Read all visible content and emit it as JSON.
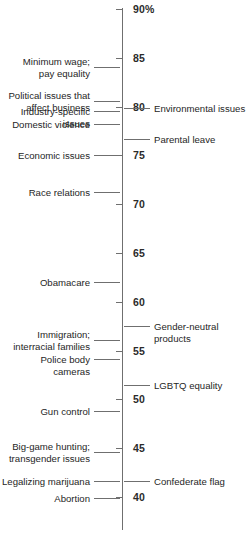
{
  "chart_data": {
    "type": "scatter",
    "title": "",
    "subtitle": "",
    "xlabel": "",
    "ylabel": "",
    "orientation": "vertical-number-line",
    "grid": false,
    "legend": null,
    "axis": {
      "min": 38,
      "max": 90,
      "tick_step": 5,
      "ticks": [
        {
          "value": 90,
          "label": "90%"
        },
        {
          "value": 85,
          "label": "85"
        },
        {
          "value": 80,
          "label": "80"
        },
        {
          "value": 75,
          "label": "75"
        },
        {
          "value": 70,
          "label": "70"
        },
        {
          "value": 65,
          "label": "65"
        },
        {
          "value": 60,
          "label": "60"
        },
        {
          "value": 55,
          "label": "55"
        },
        {
          "value": 50,
          "label": "50"
        },
        {
          "value": 45,
          "label": "45"
        },
        {
          "value": 40,
          "label": "40"
        }
      ]
    },
    "categories": [
      "Minimum wage; pay equality",
      "Political issues that affect business",
      "Environmental issues",
      "Industry-specific issues",
      "Domestic violence",
      "Parental leave",
      "Economic issues",
      "Race relations",
      "Obamacare",
      "Gender-neutral products",
      "Immigration; interracial families",
      "Police body cameras",
      "LGBTQ equality",
      "Gun control",
      "Big-game hunting; transgender issues",
      "Confederate flag",
      "Legalizing marijuana",
      "Abortion"
    ],
    "values": [
      84.1,
      80.6,
      79.9,
      79.5,
      78.2,
      76.7,
      75.0,
      71.2,
      62.0,
      57.5,
      56.1,
      54.1,
      51.5,
      48.8,
      44.6,
      41.6,
      41.6,
      39.9
    ],
    "points": [
      {
        "label": "Minimum wage;\npay equality",
        "value": 84.1,
        "side": "left"
      },
      {
        "label": "Political issues that\naffect business",
        "value": 80.6,
        "side": "left"
      },
      {
        "label": "Environmental issues",
        "value": 79.9,
        "side": "right"
      },
      {
        "label": "Industry-specific issues",
        "value": 79.5,
        "side": "left"
      },
      {
        "label": "Domestic violence",
        "value": 78.2,
        "side": "left"
      },
      {
        "label": "Parental leave",
        "value": 76.7,
        "side": "right"
      },
      {
        "label": "Economic issues",
        "value": 75.0,
        "side": "left"
      },
      {
        "label": "Race relations",
        "value": 71.2,
        "side": "left"
      },
      {
        "label": "Obamacare",
        "value": 62.0,
        "side": "left"
      },
      {
        "label": "Gender-neutral products",
        "value": 57.5,
        "side": "right"
      },
      {
        "label": "Immigration;\ninterracial families",
        "value": 56.1,
        "side": "left"
      },
      {
        "label": "Police body cameras",
        "value": 54.1,
        "side": "left"
      },
      {
        "label": "LGBTQ equality",
        "value": 51.5,
        "side": "right"
      },
      {
        "label": "Gun control",
        "value": 48.8,
        "side": "left"
      },
      {
        "label": "Big-game hunting;\ntransgender issues",
        "value": 44.6,
        "side": "left"
      },
      {
        "label": "Confederate flag",
        "value": 41.6,
        "side": "right"
      },
      {
        "label": "Legalizing marijuana",
        "value": 41.6,
        "side": "left"
      },
      {
        "label": "Abortion",
        "value": 39.9,
        "side": "left"
      }
    ],
    "colors": {
      "axis": "#6f6f6f",
      "text": "#262626",
      "tick_text": "#2b2b2b",
      "background": "#ffffff"
    }
  }
}
